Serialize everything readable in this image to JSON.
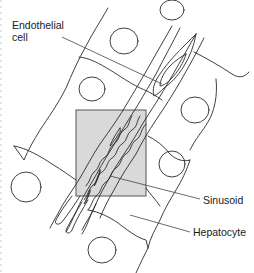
{
  "figure": {
    "type": "schematic-diagram",
    "labels": {
      "endothelial_line1": "Endothelial",
      "endothelial_line2": "cell",
      "sinusoid": "Sinusoid",
      "hepatocyte": "Hepatocyte"
    },
    "colors": {
      "stroke": "#2a2a2a",
      "leader": "#444444",
      "highlight_fill": "#d9d9d9",
      "highlight_stroke": "#555555",
      "background": "#ffffff"
    },
    "highlight_box": {
      "x": 76,
      "y": 110,
      "width": 70,
      "height": 86
    }
  }
}
